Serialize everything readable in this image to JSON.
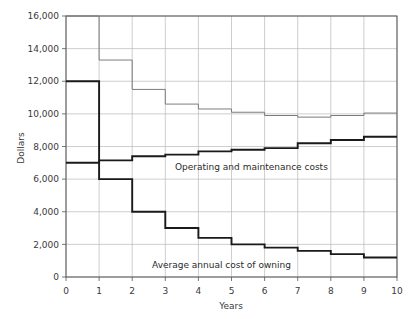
{
  "chart_data": {
    "type": "line",
    "title": "",
    "xlabel": "Years",
    "ylabel": "Dollars",
    "xlim": [
      0,
      10
    ],
    "ylim": [
      0,
      16000
    ],
    "grid": true,
    "legend_position": "inline-annotation",
    "x_ticks": [
      "0",
      "1",
      "2",
      "3",
      "4",
      "5",
      "6",
      "7",
      "8",
      "9",
      "10"
    ],
    "y_ticks": [
      "0",
      "2,000",
      "4,000",
      "6,000",
      "8,000",
      "10,000",
      "12,000",
      "14,000",
      "16,000"
    ],
    "step_interpolation": "post",
    "series": [
      {
        "name": "Total annual cost",
        "style": "thin-gray",
        "color": "#7c7c7c",
        "x": [
          1,
          2,
          3,
          4,
          5,
          6,
          7,
          8,
          9,
          10
        ],
        "values": [
          16000,
          13300,
          11500,
          10600,
          10300,
          10100,
          9900,
          9800,
          9900,
          10050
        ]
      },
      {
        "name": "Operating and maintenance costs",
        "style": "thick-black",
        "color": "#1a1a1a",
        "x": [
          1,
          2,
          3,
          4,
          5,
          6,
          7,
          8,
          9,
          10
        ],
        "values": [
          7000,
          7150,
          7400,
          7500,
          7700,
          7800,
          7900,
          8200,
          8400,
          8600
        ]
      },
      {
        "name": "Average annual cost of owning",
        "style": "thick-black",
        "color": "#1a1a1a",
        "x": [
          1,
          2,
          3,
          4,
          5,
          6,
          7,
          8,
          9,
          10
        ],
        "values": [
          12000,
          6000,
          4000,
          3000,
          2400,
          2000,
          1800,
          1600,
          1400,
          1200
        ]
      }
    ],
    "annotations": [
      {
        "text": "Operating and maintenance costs",
        "x": 3.2,
        "y": 6700
      },
      {
        "text": "Average annual cost of owning",
        "x": 2.7,
        "y": 1750
      }
    ]
  },
  "axis": {
    "y_label": "Dollars",
    "x_label": "Years",
    "y_ticks": [
      "16,000",
      "14,000",
      "12,000",
      "10,000",
      "8,000",
      "6,000",
      "4,000",
      "2,000",
      "0"
    ],
    "x_ticks": [
      "0",
      "1",
      "2",
      "3",
      "4",
      "5",
      "6",
      "7",
      "8",
      "9",
      "10"
    ]
  },
  "labels": {
    "operating": "Operating and maintenance costs",
    "owning": "Average annual cost of owning"
  },
  "colors": {
    "grid": "#b9b9b9",
    "frame": "#555555",
    "thin_series": "#7c7c7c",
    "thick_series": "#1a1a1a",
    "text": "#2b2b2b",
    "background": "#ffffff"
  }
}
